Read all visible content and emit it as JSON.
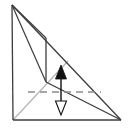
{
  "figure": {
    "type": "line-diagram",
    "canvas": {
      "width": 130,
      "height": 132,
      "background": "#ffffff"
    },
    "colors": {
      "stroke_dark": "#3c3c3c",
      "stroke_black": "#111111",
      "stroke_gray": "#b4b4b4",
      "dashed_gray": "#8c8c8c",
      "fill_none": "none",
      "fill_white": "#ffffff"
    },
    "points": {
      "apex": {
        "label": "apex",
        "x": 12,
        "y": 5
      },
      "bottom_left": {
        "label": "bottom-left",
        "x": 13,
        "y": 120
      },
      "bottom_right": {
        "label": "bottom-right",
        "x": 121,
        "y": 120
      },
      "upper_node": {
        "label": "upper-node",
        "x": 46,
        "y": 38
      },
      "lower_node": {
        "label": "lower-node",
        "x": 46,
        "y": 82
      },
      "arrow_top": {
        "label": "arrow-top",
        "x": 61,
        "y": 66
      },
      "arrow_bottom": {
        "label": "arrow-bottom",
        "x": 61,
        "y": 114
      },
      "dash_left": {
        "label": "dash-left",
        "x": 28,
        "y": 92
      },
      "dash_right": {
        "label": "dash-right",
        "x": 101,
        "y": 92
      },
      "gray_end": {
        "label": "gray-diagonal-end",
        "x": 68,
        "y": 61
      }
    },
    "segments": [
      {
        "name": "left-vertical-edge",
        "from": "apex",
        "to": "bottom_left",
        "style": "solid",
        "color": "#3c3c3c"
      },
      {
        "name": "bottom-edge",
        "from": "bottom_left",
        "to": "bottom_right",
        "style": "solid",
        "color": "#3c3c3c"
      },
      {
        "name": "hypotenuse-edge",
        "from": "apex",
        "to": "bottom_right",
        "style": "solid",
        "color": "#3c3c3c"
      },
      {
        "name": "apex-to-upper-node",
        "from": "apex",
        "to": "upper_node",
        "style": "solid",
        "color": "#3c3c3c"
      },
      {
        "name": "apex-to-lower-node",
        "from": "apex",
        "to": "lower_node",
        "style": "solid",
        "color": "#3c3c3c"
      },
      {
        "name": "upper-node-vertical",
        "from": "upper_node",
        "to": "lower_node",
        "style": "solid",
        "color": "#3c3c3c"
      },
      {
        "name": "lower-node-to-bottom-right",
        "from": "lower_node",
        "to": "bottom_right",
        "style": "solid",
        "color": "#3c3c3c"
      },
      {
        "name": "gray-diagonal",
        "from": "bottom_left",
        "to": "gray_end",
        "style": "solid",
        "color": "#b4b4b4"
      },
      {
        "name": "dashed-horizontal",
        "from": "dash_left",
        "to": "dash_right",
        "style": "dashed",
        "color": "#8c8c8c"
      }
    ],
    "arrows": {
      "name": "double-headed-vertical-arrow",
      "x": 61,
      "y_top": 66,
      "y_bottom": 114,
      "shaft_color": "#111111",
      "head_up": {
        "name": "arrowhead-up-filled",
        "fill": "#111111",
        "filled": true,
        "half_width": 6,
        "length": 12
      },
      "head_down": {
        "name": "arrowhead-down-hollow",
        "fill": "#ffffff",
        "filled": false,
        "half_width": 6,
        "length": 12
      }
    }
  }
}
